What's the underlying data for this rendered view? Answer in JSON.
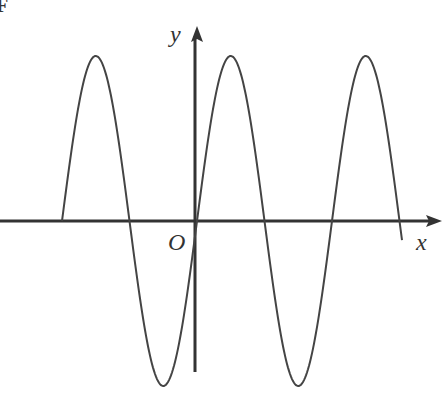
{
  "figure": {
    "corner_label": "F",
    "x_label": "x",
    "y_label": "y",
    "origin_label": "O",
    "colors": {
      "axis": "#333333",
      "curve": "#444444",
      "background": "#ffffff"
    }
  },
  "chart_data": {
    "type": "line",
    "title": "",
    "xlabel": "x",
    "ylabel": "y",
    "grid": false,
    "legend": null,
    "pixel_geometry": {
      "axis_y_px": 221,
      "axis_x_px": 195,
      "amplitude_px": 165,
      "period_px": 135,
      "curve_start_x_px": 62,
      "curve_end_x_px": 400,
      "zero_crossings_x_px": [
        62,
        128,
        195,
        262,
        332,
        398
      ],
      "peaks_x_px": [
        96,
        230,
        366
      ],
      "troughs_x_px": [
        162,
        298
      ]
    }
  }
}
